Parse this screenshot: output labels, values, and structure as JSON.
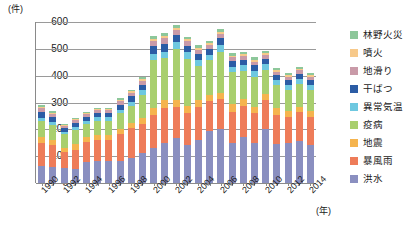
{
  "chart_data": {
    "type": "bar",
    "stacked": true,
    "title": "",
    "subtitle": "",
    "xlabel": "(年)",
    "ylabel": "(件)",
    "ylim": [
      0,
      600
    ],
    "ytick_labels": [
      "600",
      "500",
      "400",
      "300",
      "200",
      "100",
      "0"
    ],
    "ytick_values": [
      600,
      500,
      400,
      300,
      200,
      100,
      0
    ],
    "grid": true,
    "legend_position": "right",
    "categories": [
      "1990",
      "1991",
      "1992",
      "1993",
      "1994",
      "1995",
      "1996",
      "1997",
      "1998",
      "1999",
      "2000",
      "2001",
      "2002",
      "2003",
      "2004",
      "2005",
      "2006",
      "2007",
      "2008",
      "2009",
      "2010",
      "2011",
      "2012",
      "2013",
      "2014"
    ],
    "xtick_labels": [
      "1990",
      "",
      "1992",
      "",
      "1994",
      "",
      "1996",
      "",
      "1998",
      "",
      "2000",
      "",
      "2002",
      "",
      "2004",
      "",
      "2006",
      "",
      "2008",
      "",
      "2010",
      "",
      "2012",
      "",
      "2014"
    ],
    "series": [
      {
        "name": "洪水",
        "color": "#8a8fc0",
        "values": [
          62,
          60,
          56,
          52,
          80,
          82,
          82,
          82,
          95,
          110,
          132,
          150,
          167,
          140,
          160,
          195,
          200,
          148,
          170,
          148,
          200,
          145,
          148,
          155,
          140
        ]
      },
      {
        "name": "暴風雨",
        "color": "#ee7c59",
        "values": [
          88,
          82,
          60,
          72,
          72,
          78,
          78,
          100,
          110,
          110,
          120,
          130,
          115,
          120,
          122,
          110,
          112,
          118,
          118,
          112,
          108,
          110,
          98,
          108,
          105
        ]
      },
      {
        "name": "地震",
        "color": "#f5b44e",
        "values": [
          20,
          18,
          16,
          20,
          18,
          20,
          18,
          20,
          20,
          22,
          28,
          30,
          26,
          28,
          28,
          24,
          25,
          28,
          26,
          25,
          24,
          23,
          22,
          22,
          22
        ]
      },
      {
        "name": "疫病",
        "color": "#a9cf6e",
        "values": [
          60,
          55,
          50,
          52,
          50,
          52,
          54,
          58,
          62,
          85,
          178,
          155,
          190,
          175,
          125,
          128,
          152,
          118,
          105,
          110,
          90,
          88,
          80,
          85,
          80
        ]
      },
      {
        "name": "異常気温",
        "color": "#6ec8e0",
        "values": [
          14,
          12,
          10,
          12,
          12,
          13,
          13,
          14,
          16,
          18,
          24,
          25,
          26,
          24,
          22,
          20,
          24,
          20,
          20,
          22,
          20,
          18,
          18,
          18,
          18
        ]
      },
      {
        "name": "干ばつ",
        "color": "#2b5ca5",
        "values": [
          22,
          20,
          14,
          16,
          15,
          16,
          16,
          18,
          20,
          22,
          28,
          30,
          28,
          25,
          24,
          22,
          26,
          22,
          20,
          22,
          20,
          18,
          18,
          20,
          18
        ]
      },
      {
        "name": "地滑り",
        "color": "#c99aa8",
        "values": [
          12,
          10,
          8,
          10,
          9,
          10,
          10,
          12,
          13,
          14,
          18,
          19,
          18,
          16,
          16,
          15,
          17,
          14,
          14,
          14,
          14,
          13,
          12,
          12,
          12
        ]
      },
      {
        "name": "噴火",
        "color": "#f7c98a",
        "values": [
          6,
          5,
          4,
          5,
          5,
          5,
          5,
          6,
          6,
          7,
          9,
          9,
          9,
          8,
          8,
          7,
          8,
          7,
          7,
          7,
          7,
          6,
          6,
          6,
          6
        ]
      },
      {
        "name": "林野火災",
        "color": "#8dc79a",
        "values": [
          6,
          5,
          4,
          5,
          5,
          5,
          5,
          6,
          6,
          7,
          11,
          12,
          11,
          10,
          10,
          9,
          11,
          9,
          9,
          9,
          9,
          8,
          8,
          8,
          8
        ]
      }
    ],
    "totals": [
      290,
      267,
      222,
      244,
      266,
      281,
      281,
      316,
      348,
      395,
      548,
      560,
      590,
      546,
      515,
      530,
      575,
      484,
      489,
      469,
      492,
      429,
      410,
      434,
      409
    ]
  },
  "axis": {
    "y_unit_label": "(件)",
    "x_unit_label": "(年)"
  },
  "legend": {
    "items": [
      {
        "label": "林野火災",
        "color": "#8dc79a"
      },
      {
        "label": "噴火",
        "color": "#f7c98a"
      },
      {
        "label": "地滑り",
        "color": "#c99aa8"
      },
      {
        "label": "干ばつ",
        "color": "#2b5ca5"
      },
      {
        "label": "異常気温",
        "color": "#6ec8e0"
      },
      {
        "label": "疫病",
        "color": "#a9cf6e"
      },
      {
        "label": "地震",
        "color": "#f5b44e"
      },
      {
        "label": "暴風雨",
        "color": "#ee7c59"
      },
      {
        "label": "洪水",
        "color": "#8a8fc0"
      }
    ]
  }
}
